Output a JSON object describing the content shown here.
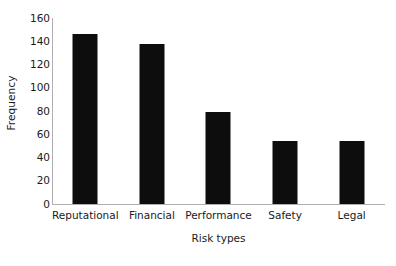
{
  "chart_data": {
    "type": "bar",
    "title": "",
    "subtitle": "",
    "categories": [
      "Reputational",
      "Financial",
      "Performance",
      "Safety",
      "Legal"
    ],
    "values": [
      146,
      138,
      79,
      54,
      54
    ],
    "xlabel": "Risk types",
    "ylabel": "Frequency",
    "ylim": [
      0,
      160
    ],
    "ytick_labels": [
      "160",
      "140",
      "120",
      "100",
      "80",
      "60",
      "40",
      "20",
      "0"
    ],
    "ytick_values": [
      160,
      140,
      120,
      100,
      80,
      60,
      40,
      20,
      0
    ],
    "grid": false,
    "legend": false,
    "legend_position": "none",
    "bar_color": "#0d0d0d",
    "axis_color": "#b0b0b0",
    "text_color": "#1a1a1a",
    "background_color": "#ffffff"
  }
}
